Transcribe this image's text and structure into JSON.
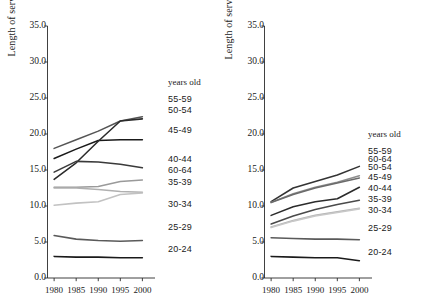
{
  "figure": {
    "background": "#ffffff",
    "width": 436,
    "height": 307
  },
  "chart_data": [
    {
      "type": "line",
      "panel": "left",
      "title": "",
      "xlabel": "",
      "ylabel": "Length of service (years)",
      "x": [
        1980,
        1985,
        1990,
        1995,
        2000
      ],
      "xlim": [
        1978.5,
        2001.5
      ],
      "ylim": [
        0.0,
        35.0
      ],
      "xticks": [
        1980,
        1985,
        1990,
        1995,
        2000
      ],
      "xticklabels": [
        "1980",
        "1985",
        "1990",
        "1995",
        "2000"
      ],
      "yticks": [
        0.0,
        5.0,
        10.0,
        15.0,
        20.0,
        25.0,
        30.0,
        35.0
      ],
      "yticklabels": [
        "0.0",
        "5.0",
        "10.0",
        "15.0",
        "20.0",
        "25.0",
        "30.0",
        "35.0"
      ],
      "grid": false,
      "legend_title": "years old",
      "legend_position": "right",
      "series": [
        {
          "name": "55-59",
          "values": [
            18.0,
            19.2,
            20.4,
            21.8,
            22.4
          ],
          "color": "#555555"
        },
        {
          "name": "50-54",
          "values": [
            16.6,
            17.9,
            19.1,
            19.2,
            19.2
          ],
          "color": "#1a1a1a"
        },
        {
          "name": "45-49",
          "values": [
            13.7,
            16.0,
            19.0,
            21.8,
            22.1
          ],
          "color": "#2b2b2b"
        },
        {
          "name": "40-44",
          "values": [
            14.7,
            16.2,
            16.1,
            15.8,
            15.3
          ],
          "color": "#3a3a3a"
        },
        {
          "name": "60-64",
          "values": [
            12.6,
            12.6,
            12.7,
            13.4,
            13.6
          ],
          "color": "#9a9a9a"
        },
        {
          "name": "35-39",
          "values": [
            12.5,
            12.5,
            12.3,
            12.0,
            11.9
          ],
          "color": "#b0b0b0"
        },
        {
          "name": "30-34",
          "values": [
            10.1,
            10.4,
            10.6,
            11.6,
            11.8
          ],
          "color": "#c2c2c2"
        },
        {
          "name": "25-29",
          "values": [
            5.9,
            5.4,
            5.2,
            5.1,
            5.2
          ],
          "color": "#5a5a5a"
        },
        {
          "name": "20-24",
          "values": [
            3.0,
            2.9,
            2.9,
            2.8,
            2.8
          ],
          "color": "#1a1a1a"
        }
      ]
    },
    {
      "type": "line",
      "panel": "right",
      "title": "",
      "xlabel": "",
      "ylabel": "Length of service (years)",
      "x": [
        1980,
        1985,
        1990,
        1995,
        2000
      ],
      "xlim": [
        1978.5,
        2001.5
      ],
      "ylim": [
        0.0,
        35.0
      ],
      "xticks": [
        1980,
        1985,
        1990,
        1995,
        2000
      ],
      "xticklabels": [
        "1980",
        "1985",
        "1990",
        "1995",
        "2000"
      ],
      "yticks": [
        0.0,
        5.0,
        10.0,
        15.0,
        20.0,
        25.0,
        30.0,
        35.0
      ],
      "yticklabels": [
        "0.0",
        "5.0",
        "10.0",
        "15.0",
        "20.0",
        "25.0",
        "30.0",
        "35.0"
      ],
      "grid": false,
      "legend_title": "years old",
      "legend_position": "right",
      "series": [
        {
          "name": "55-59",
          "values": [
            10.6,
            12.5,
            13.4,
            14.3,
            15.5
          ],
          "color": "#333333"
        },
        {
          "name": "60-64",
          "values": [
            10.5,
            11.7,
            12.6,
            13.3,
            14.2
          ],
          "color": "#8d8d8d"
        },
        {
          "name": "50-54",
          "values": [
            10.5,
            11.6,
            12.5,
            13.2,
            13.9
          ],
          "color": "#6b6b6b"
        },
        {
          "name": "45-49",
          "values": [
            8.7,
            9.9,
            10.6,
            11.0,
            12.6
          ],
          "color": "#2b2b2b"
        },
        {
          "name": "40-44",
          "values": [
            7.5,
            8.6,
            9.5,
            10.2,
            10.8
          ],
          "color": "#4a4a4a"
        },
        {
          "name": "35-39",
          "values": [
            7.1,
            8.0,
            8.7,
            9.2,
            9.7
          ],
          "color": "#b5b5b5"
        },
        {
          "name": "30-34",
          "values": [
            7.0,
            7.9,
            8.6,
            9.1,
            9.6
          ],
          "color": "#c8c8c8"
        },
        {
          "name": "25-29",
          "values": [
            5.6,
            5.5,
            5.4,
            5.4,
            5.3
          ],
          "color": "#5a5a5a"
        },
        {
          "name": "20-24",
          "values": [
            3.0,
            2.9,
            2.8,
            2.8,
            2.4
          ],
          "color": "#1a1a1a"
        }
      ]
    }
  ],
  "panels": {
    "left": {
      "ylabel": "Length of service (years)",
      "yticklabels": [
        "35.0",
        "30.0",
        "25.0",
        "20.0",
        "15.0",
        "10.0",
        "5.0",
        "0.0"
      ],
      "xticklabels": [
        "1980",
        "1985",
        "1990",
        "1995",
        "2000"
      ],
      "legend_title": "years old",
      "legend_entries": [
        "55-59",
        "50-54",
        "45-49",
        "40-44",
        "60-64",
        "35-39",
        "30-34",
        "25-29",
        "20-24"
      ]
    },
    "right": {
      "ylabel": "Length of service (years)",
      "yticklabels": [
        "35.0",
        "30.0",
        "25.0",
        "20.0",
        "15.0",
        "10.0",
        "5.0",
        "0.0"
      ],
      "xticklabels": [
        "1980",
        "1985",
        "1990",
        "1995",
        "2000"
      ],
      "legend_title": "years old",
      "legend_entries": [
        "55-59",
        "60-64",
        "50-54",
        "45-49",
        "40-44",
        "35-39",
        "30-34",
        "25-29",
        "20-24"
      ]
    }
  }
}
